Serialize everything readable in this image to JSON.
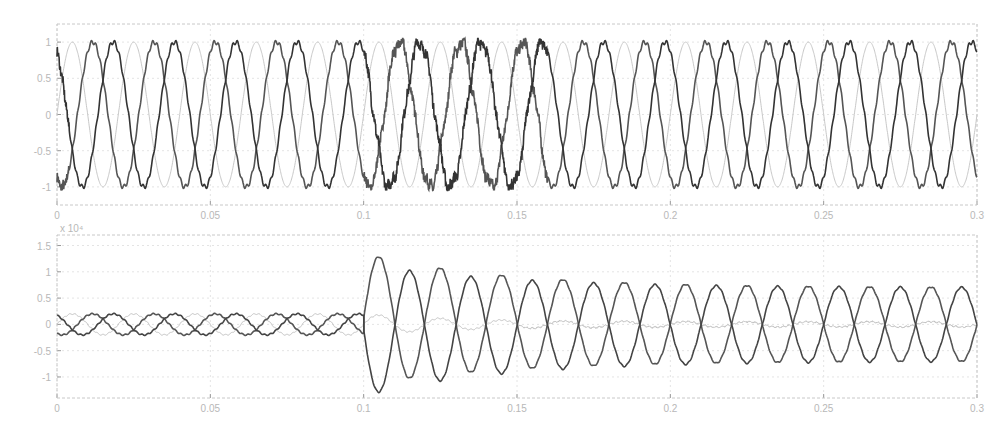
{
  "chart_data": [
    {
      "type": "line",
      "title": "",
      "xlabel": "",
      "ylabel": "",
      "xlim": [
        0,
        0.3
      ],
      "ylim": [
        -1.25,
        1.25
      ],
      "grid": true,
      "legend": "none",
      "xticks": [
        "0",
        "0.05",
        "0.1",
        "0.15",
        "0.2",
        "0.25",
        "0.3"
      ],
      "yticks": [
        "1",
        "0.5",
        "0",
        "-0.5",
        "-1"
      ],
      "frequency_hz": 50,
      "description": "Three-phase normalized voltage, amplitude ~1, 120° phase shift; distortion on two phases around t=0.1–0.16 s",
      "series": [
        {
          "name": "phase-a",
          "amplitude": 1.0,
          "phase_deg": 0,
          "color": "#c8c8c8",
          "disturbance": null
        },
        {
          "name": "phase-b",
          "amplitude": 1.0,
          "phase_deg": -120,
          "color": "#555555",
          "disturbance": [
            0.1,
            0.16
          ]
        },
        {
          "name": "phase-c",
          "amplitude": 1.0,
          "phase_deg": 120,
          "color": "#333333",
          "disturbance": [
            0.1,
            0.16
          ]
        }
      ]
    },
    {
      "type": "line",
      "title": "",
      "xlabel": "",
      "ylabel": "",
      "y_multiplier": "x 10^4",
      "xlim": [
        0,
        0.3
      ],
      "ylim": [
        -1.4,
        1.7
      ],
      "grid": true,
      "legend": "none",
      "xticks": [
        "0",
        "0.05",
        "0.1",
        "0.15",
        "0.2",
        "0.25",
        "0.3"
      ],
      "yticks": [
        "1.5",
        "1",
        "0.5",
        "0",
        "-0.5",
        "-1"
      ],
      "frequency_hz": 50,
      "description": "Three-phase current (x10^4); amplitude ~0.2 before t=0.1 s, then fault: two phases swing to ~1.3 peak decaying to ~0.7, third phase drops near zero",
      "series": [
        {
          "name": "phase-a",
          "pre_fault_amplitude": 0.2,
          "post_fault_peak": 0.2,
          "steady_post": 0.05,
          "color": "#c0c0c0"
        },
        {
          "name": "phase-b",
          "pre_fault_amplitude": 0.2,
          "post_fault_peak": 1.35,
          "steady_post": 0.7,
          "color": "#555555"
        },
        {
          "name": "phase-c",
          "pre_fault_amplitude": 0.2,
          "post_fault_peak": -1.1,
          "steady_post": 0.7,
          "color": "#444444"
        }
      ],
      "fault_time": 0.1
    }
  ],
  "top": {
    "xticks": [
      "0",
      "0.05",
      "0.1",
      "0.15",
      "0.2",
      "0.25",
      "0.3"
    ],
    "yticks": [
      "1",
      "0.5",
      "0",
      "-0.5",
      "-1"
    ]
  },
  "bottom": {
    "exponent": "x 10⁴",
    "xticks": [
      "0",
      "0.05",
      "0.1",
      "0.15",
      "0.2",
      "0.25",
      "0.3"
    ],
    "yticks": [
      "1.5",
      "1",
      "0.5",
      "0",
      "-0.5",
      "-1"
    ]
  }
}
